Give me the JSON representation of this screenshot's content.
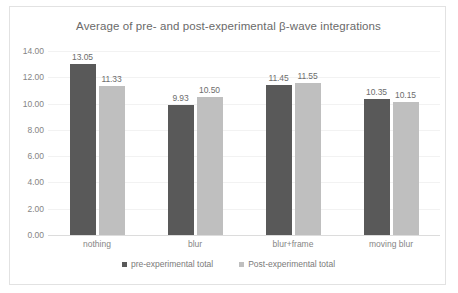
{
  "chart_data": {
    "type": "bar",
    "title": "Average of pre- and post-experimental β-wave integrations",
    "xlabel": "",
    "ylabel": "",
    "categories": [
      "nothing",
      "blur",
      "blur+frame",
      "moving blur"
    ],
    "series": [
      {
        "name": "pre-experimental total",
        "color": "#595959",
        "values": [
          13.05,
          9.93,
          11.45,
          10.35
        ],
        "labels": [
          "13.05",
          "9.93",
          "11.45",
          "10.35"
        ]
      },
      {
        "name": "Post-experimental total",
        "color": "#bfbfbf",
        "values": [
          11.33,
          10.5,
          11.55,
          10.15
        ],
        "labels": [
          "11.33",
          "10.50",
          "11.55",
          "10.15"
        ]
      }
    ],
    "ylim": [
      0,
      14
    ],
    "ytick_step": 2,
    "ytick_labels": [
      "0.00",
      "2.00",
      "4.00",
      "6.00",
      "8.00",
      "10.00",
      "12.00",
      "14.00"
    ],
    "grid": true,
    "legend_position": "bottom",
    "frame_border_color": "#e2e2e2",
    "gridline_color": "#f2f2f2",
    "text_color": "#858585",
    "title_color": "#6a6a6a"
  }
}
